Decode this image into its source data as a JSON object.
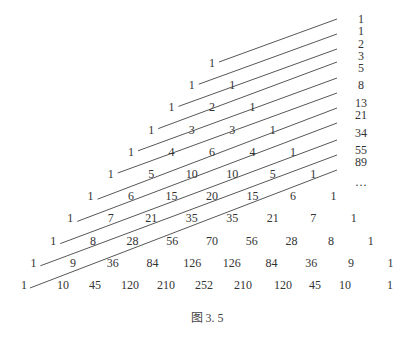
{
  "figure": {
    "caption": "图 3. 5"
  },
  "triangle": {
    "rows": [
      [
        1
      ],
      [
        1,
        1
      ],
      [
        1,
        2,
        1
      ],
      [
        1,
        3,
        3,
        1
      ],
      [
        1,
        4,
        6,
        4,
        1
      ],
      [
        1,
        5,
        10,
        10,
        5,
        1
      ],
      [
        1,
        6,
        15,
        20,
        15,
        6,
        1
      ],
      [
        1,
        7,
        21,
        35,
        35,
        21,
        7,
        1
      ],
      [
        1,
        8,
        28,
        56,
        70,
        56,
        28,
        8,
        1
      ],
      [
        1,
        9,
        36,
        84,
        126,
        126,
        84,
        36,
        9,
        1
      ],
      [
        1,
        10,
        45,
        120,
        210,
        252,
        210,
        120,
        45,
        10,
        1
      ]
    ]
  },
  "fibonacci": {
    "labels": [
      "1",
      "1",
      "2",
      "3",
      "5",
      "8",
      "13",
      "21",
      "34",
      "55",
      "89",
      "…"
    ]
  },
  "colors": {
    "text": "#333333",
    "line": "#444444",
    "background": "#ffffff"
  }
}
